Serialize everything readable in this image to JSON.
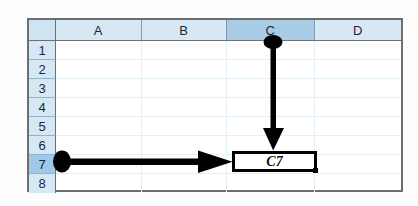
{
  "app": {
    "type": "spreadsheet",
    "title": "Spreadsheet cell reference illustration"
  },
  "grid": {
    "corner_label": "",
    "columns": [
      {
        "label": "A",
        "selected": false
      },
      {
        "label": "B",
        "selected": false
      },
      {
        "label": "C",
        "selected": true
      },
      {
        "label": "D",
        "selected": false
      }
    ],
    "rows": [
      {
        "label": "1",
        "selected": false
      },
      {
        "label": "2",
        "selected": false
      },
      {
        "label": "3",
        "selected": false
      },
      {
        "label": "4",
        "selected": false
      },
      {
        "label": "5",
        "selected": false
      },
      {
        "label": "6",
        "selected": false
      },
      {
        "label": "7",
        "selected": true
      },
      {
        "label": "8",
        "selected": false
      }
    ],
    "cells": []
  },
  "selection": {
    "cell_reference": "C7",
    "column": "C",
    "row": "7",
    "label_text": "C7",
    "has_fill_handle": true
  },
  "annotations": {
    "column_pointer": {
      "name": "column-c-arrow",
      "from": "C column header",
      "to": "C7 cell",
      "direction": "down",
      "color": "#000000"
    },
    "row_pointer": {
      "name": "row-7-arrow",
      "from": "row 7 header",
      "to": "C7 cell",
      "direction": "right",
      "color": "#000000"
    }
  },
  "colors": {
    "header_fill": "#d6e8f4",
    "header_selected_fill": "#a8cce6",
    "row_selected_fill": "#9ec9e8",
    "grid_line": "#e3eff7",
    "frame_border": "#6e6e70",
    "arrow": "#000000",
    "selection_border": "#000000",
    "cell_background": "#ffffff"
  }
}
